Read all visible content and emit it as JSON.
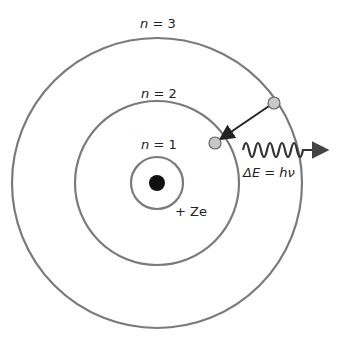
{
  "labels": {
    "n3": "n = 3",
    "n2": "n = 2",
    "n1": "n = 1",
    "nucleus_charge": "+ Ze",
    "energy": "ΔE = hν"
  },
  "colors": {
    "orbit": "#7a7a7a",
    "electron": "#c8c8c8",
    "nucleus": "#111111",
    "arrow": "#222222",
    "photon": "#333333"
  }
}
